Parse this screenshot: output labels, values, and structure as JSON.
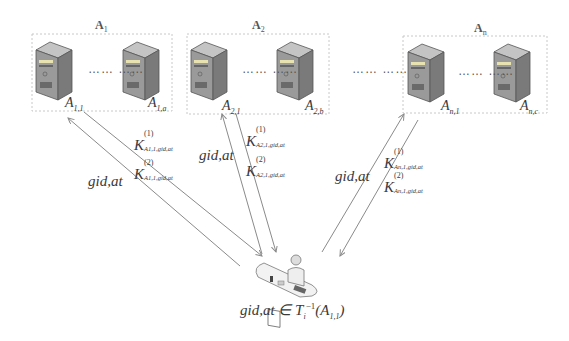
{
  "diagram": {
    "groups": [
      {
        "name": "A",
        "sub": "1",
        "servers": [
          {
            "name": "A",
            "sub": "1,1"
          },
          {
            "name": "A",
            "sub": "1,a"
          }
        ]
      },
      {
        "name": "A",
        "sub": "2",
        "servers": [
          {
            "name": "A",
            "sub": "2,1"
          },
          {
            "name": "A",
            "sub": "2,b"
          }
        ]
      },
      {
        "name": "A",
        "sub": "n",
        "servers": [
          {
            "name": "A",
            "sub": "n,1"
          },
          {
            "name": "A",
            "sub": "n,c"
          }
        ]
      }
    ],
    "ellipsis": "…… ……",
    "between_groups": "…… ……",
    "messages": [
      {
        "request": "gid,at",
        "key1": "K",
        "key1_sup": "(1)",
        "key1_sub": "A1,1,gid,at",
        "key2": "K",
        "key2_sup": "(2)",
        "key2_sub": "A1,1,gid,at"
      },
      {
        "request": "gid,at",
        "key1": "K",
        "key1_sup": "(1)",
        "key1_sub": "A2,1,gid,at",
        "key2": "K",
        "key2_sup": "(2)",
        "key2_sub": "A2,1,gid,at"
      },
      {
        "request": "gid,at",
        "key1": "K",
        "key1_sup": "(1)",
        "key1_sub": "An,1,gid,at",
        "key2": "K",
        "key2_sup": "(2)",
        "key2_sub": "An,1,gid,at"
      }
    ],
    "user": {
      "condition_prefix": "gid,at ∈ T",
      "condition_sub": "i",
      "condition_sup": "−1",
      "condition_arg": "(A",
      "condition_arg_sub": "1,1",
      "condition_close": ")"
    },
    "colors": {
      "line": "#8a8a8a",
      "box_border": "#c8c8c8",
      "server_front": "#9a9a9a",
      "server_top": "#c4c4c4",
      "server_side": "#7a7a7a"
    }
  }
}
